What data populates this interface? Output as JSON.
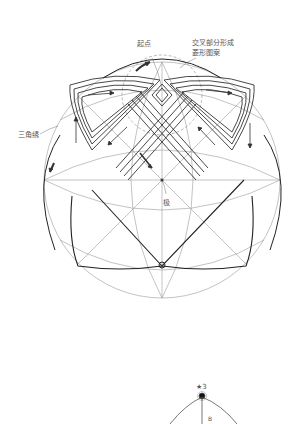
{
  "diagram_top": {
    "labels": {
      "start_point": "起点",
      "intersection_line1": "交叉部分形成",
      "intersection_line2": "菱形图案",
      "triangle_stitch": "三角绣",
      "pole": "极"
    },
    "colors": {
      "guide_line": "#9a9a9a",
      "stitch_line": "#333333",
      "outline": "#222222",
      "dashed_circle": "#999999",
      "label_text": "#555555"
    }
  },
  "diagram_bottom": {
    "labels": {
      "star_marker": "★3",
      "side_note": "B"
    }
  }
}
